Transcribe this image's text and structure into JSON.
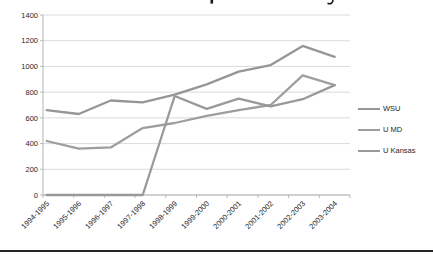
{
  "page": {
    "title_cropped": true,
    "bottom_rule_color": "#262626"
  },
  "chart_data": {
    "type": "line",
    "title": "",
    "categories": [
      "1994-1995",
      "1995-1996",
      "1996-1997",
      "1997-1998",
      "1998-1999",
      "1999-2000",
      "2000-2001",
      "2001-2002",
      "2002-2003",
      "2003-2004"
    ],
    "series": [
      {
        "name": "WSU",
        "color": "#969696",
        "values": [
          660,
          630,
          735,
          720,
          780,
          860,
          960,
          1010,
          1160,
          1075
        ]
      },
      {
        "name": "U MD",
        "color": "#9e9e9e",
        "values": [
          420,
          360,
          370,
          520,
          560,
          615,
          660,
          700,
          930,
          855
        ]
      },
      {
        "name": "U Kansas",
        "color": "#999999",
        "values": [
          0,
          0,
          0,
          0,
          770,
          670,
          750,
          690,
          745,
          855
        ]
      }
    ],
    "ylim": [
      0,
      1400
    ],
    "yticks": [
      0,
      200,
      400,
      600,
      800,
      1000,
      1200,
      1400
    ],
    "grid": true,
    "legend_position": "right",
    "xlabel": "",
    "ylabel": ""
  },
  "style": {
    "grid_color": "#d6d6d6",
    "axis_color": "#b3b3b3",
    "label_color": "#262626",
    "line_width": 2.3
  }
}
